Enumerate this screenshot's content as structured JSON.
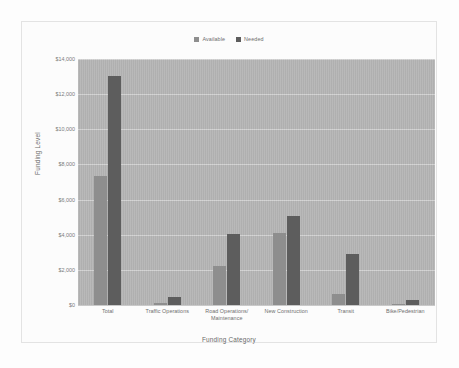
{
  "chart_data": {
    "type": "bar",
    "title": "",
    "xlabel": "Funding Category",
    "ylabel": "Funding Level",
    "categories": [
      "Total",
      "Traffic Operations",
      "Road Operations/ Maintenance",
      "New Construction",
      "Transit",
      "Bike/Pedestrian"
    ],
    "series": [
      {
        "name": "Available",
        "color": "#8e8e8e",
        "values": [
          7340,
          100,
          2200,
          4100,
          630,
          40
        ]
      },
      {
        "name": "Needed",
        "color": "#5d5d5d",
        "values": [
          13040,
          450,
          4050,
          5070,
          2900,
          270
        ]
      }
    ],
    "ylim": [
      0,
      14000
    ],
    "y_ticks": [
      0,
      2000,
      4000,
      6000,
      8000,
      10000,
      12000,
      14000
    ],
    "y_tick_labels": [
      "$0",
      "$2,000",
      "$4,000",
      "$6,000",
      "$8,000",
      "$10,000",
      "$12,000",
      "$14,000"
    ],
    "grid": true,
    "legend_position": "top-center",
    "plot_background": "#b5b5b5"
  },
  "legend": {
    "entries": [
      {
        "label": "Available",
        "color": "#8e8e8e"
      },
      {
        "label": "Needed",
        "color": "#5d5d5d"
      }
    ]
  },
  "axes": {
    "x_title": "Funding Category",
    "y_title": "Funding Level"
  }
}
